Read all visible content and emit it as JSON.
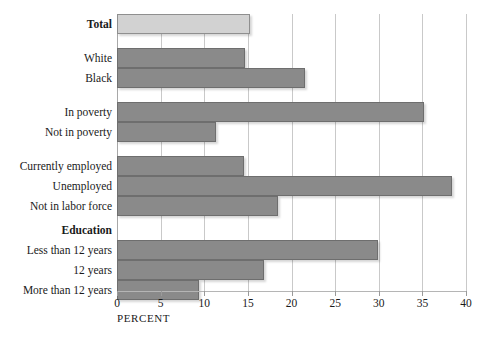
{
  "chart_data": {
    "type": "bar",
    "orientation": "horizontal",
    "title": "",
    "xlabel": "PERCENT",
    "ylabel": "",
    "xlim": [
      0,
      40
    ],
    "xticks": [
      0,
      5,
      10,
      15,
      20,
      25,
      30,
      35,
      40
    ],
    "xtick_labels": [
      "0",
      "5",
      "10",
      "15",
      "20",
      "25",
      "30",
      "35",
      "40"
    ],
    "grid": true,
    "legend": "none",
    "categories": [
      "Total",
      "White",
      "Black",
      "In poverty",
      "Not in poverty",
      "Currently employed",
      "Unemployed",
      "Not in labor force",
      "Education",
      "Less than 12 years",
      "12 years",
      "More than 12 years"
    ],
    "values": [
      15.3,
      14.7,
      21.6,
      35.2,
      11.3,
      14.5,
      38.4,
      18.5,
      null,
      29.9,
      16.8,
      9.4
    ],
    "rows": [
      {
        "label": "Total",
        "value": 15.3,
        "bold": true,
        "highlight": true,
        "bar": true,
        "top": 0
      },
      {
        "label": "White",
        "value": 14.7,
        "bold": false,
        "highlight": false,
        "bar": true,
        "top": 34
      },
      {
        "label": "Black",
        "value": 21.6,
        "bold": false,
        "highlight": false,
        "bar": true,
        "top": 54
      },
      {
        "label": "In poverty",
        "value": 35.2,
        "bold": false,
        "highlight": false,
        "bar": true,
        "top": 88
      },
      {
        "label": "Not in poverty",
        "value": 11.3,
        "bold": false,
        "highlight": false,
        "bar": true,
        "top": 108
      },
      {
        "label": "Currently employed",
        "value": 14.5,
        "bold": false,
        "highlight": false,
        "bar": true,
        "top": 142
      },
      {
        "label": "Unemployed",
        "value": 38.4,
        "bold": false,
        "highlight": false,
        "bar": true,
        "top": 162
      },
      {
        "label": "Not in labor force",
        "value": 18.5,
        "bold": false,
        "highlight": false,
        "bar": true,
        "top": 182
      },
      {
        "label": "Education",
        "value": null,
        "bold": true,
        "highlight": false,
        "bar": false,
        "top": 206
      },
      {
        "label": "Less than 12 years",
        "value": 29.9,
        "bold": false,
        "highlight": false,
        "bar": true,
        "top": 226
      },
      {
        "label": "12 years",
        "value": 16.8,
        "bold": false,
        "highlight": false,
        "bar": true,
        "top": 246
      },
      {
        "label": "More than 12 years",
        "value": 9.4,
        "bold": false,
        "highlight": false,
        "bar": true,
        "top": 266
      }
    ],
    "colors": {
      "bar": "#8a8a8a",
      "bar_border": "#6e6e6e",
      "bar_highlight": "#d2d2d2",
      "bar_highlight_border": "#8f8f8f",
      "gridline": "#c9c9c9",
      "axis": "#a8a8a8",
      "text": "#1a1a1a",
      "background": "#ffffff"
    }
  }
}
